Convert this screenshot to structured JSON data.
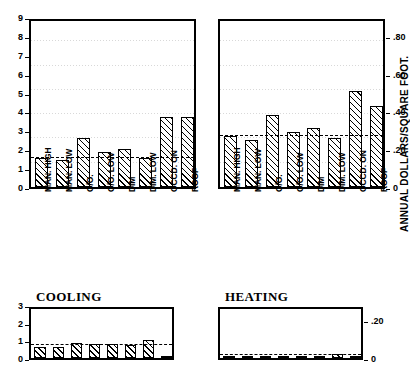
{
  "figure": {
    "right_axis_label": "ANNUAL DOLLARS/SQUARE FOOT.",
    "categories": [
      "MAN. HIGH",
      "MAN. LOW",
      "O/O.",
      "O/O. LOW",
      "DIM",
      "DIM. LOW",
      "OCCD. ON",
      "ROOF"
    ]
  },
  "chart_data": [
    {
      "type": "bar",
      "title": "LIGHTING",
      "categories": [
        "MAN. HIGH",
        "MAN. LOW",
        "O/O.",
        "O/O. LOW",
        "DIM",
        "DIM. LOW",
        "OCCD. ON",
        "ROOF"
      ],
      "values": [
        1.55,
        1.45,
        2.6,
        1.85,
        2.0,
        1.55,
        3.7,
        3.7
      ],
      "reference_line": 1.55,
      "ylim": [
        0,
        9
      ],
      "yticks": [
        "0",
        "1",
        "2",
        "3",
        "4",
        "5",
        "6",
        "7",
        "8",
        "9"
      ],
      "ylabel": "",
      "xlabel": "",
      "grid": true,
      "legend": "none"
    },
    {
      "type": "bar",
      "title": "TOTAL",
      "categories": [
        "MAN. HIGH",
        "MAN. LOW",
        "O/O.",
        "O/O. LOW",
        "DIM",
        "DIM. LOW",
        "OCCD. ON",
        "ROOF"
      ],
      "values": [
        0.27,
        0.25,
        0.38,
        0.29,
        0.31,
        0.26,
        0.51,
        0.43
      ],
      "reference_line": 0.27,
      "ylim": [
        0,
        0.9
      ],
      "yticks": [
        "0",
        ".20",
        ".40",
        ".60",
        ".80"
      ],
      "ytick_values": [
        0,
        0.2,
        0.4,
        0.6,
        0.8
      ],
      "ylabel": "ANNUAL DOLLARS/SQUARE FOOT.",
      "xlabel": "",
      "grid": true,
      "legend": "none"
    },
    {
      "type": "bar",
      "title": "COOLING",
      "categories": [
        "MAN. HIGH",
        "MAN. LOW",
        "O/O.",
        "O/O. LOW",
        "DIM",
        "DIM. LOW",
        "OCCD. ON",
        "ROOF"
      ],
      "values": [
        0.65,
        0.65,
        0.85,
        0.8,
        0.8,
        0.75,
        1.0,
        0.1
      ],
      "reference_line": 0.75,
      "ylim": [
        0,
        3
      ],
      "yticks": [
        "0",
        "1",
        "2",
        "3"
      ],
      "ylabel": "",
      "xlabel": "",
      "grid": false,
      "legend": "none"
    },
    {
      "type": "bar",
      "title": "HEATING",
      "categories": [
        "MAN. HIGH",
        "MAN. LOW",
        "O/O.",
        "O/O. LOW",
        "DIM",
        "DIM. LOW",
        "OCCD. ON",
        "ROOF"
      ],
      "values": [
        0.012,
        0.012,
        0.012,
        0.012,
        0.012,
        0.012,
        0.022,
        0.012
      ],
      "reference_line": 0.014,
      "ylim": [
        0,
        0.28
      ],
      "yticks": [
        "0",
        ".20"
      ],
      "ytick_values": [
        0,
        0.2
      ],
      "ylabel": "",
      "xlabel": "",
      "grid": false,
      "legend": "none"
    }
  ]
}
